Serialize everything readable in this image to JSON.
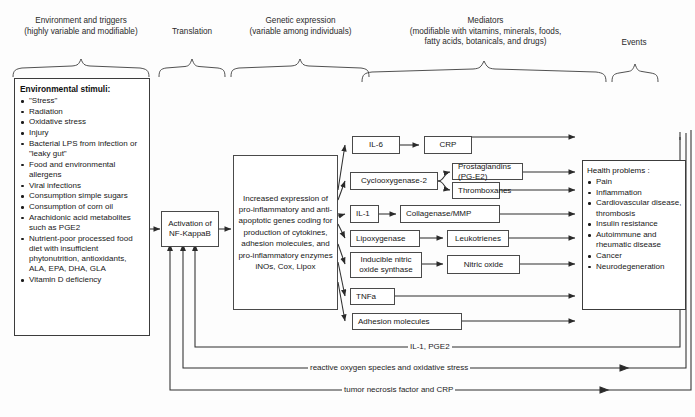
{
  "diagram": {
    "columns": [
      {
        "id": "environment",
        "label": "Environment and triggers\n(highly variable and modifiable)"
      },
      {
        "id": "translation",
        "label": "Translation"
      },
      {
        "id": "genetic",
        "label": "Genetic expression\n(variable among individuals)"
      },
      {
        "id": "mediators",
        "label": "Mediators\n(modifiable with vitamins, minerals, foods,\nfatty acids, botanicals, and drugs)"
      },
      {
        "id": "events",
        "label": "Events"
      }
    ],
    "environment_box": {
      "heading": "Environmental stimuli:",
      "items": [
        "\"Stress\"",
        "Radiation",
        "Oxidative stress",
        "Injury",
        "Bacterial LPS from infection or \"leaky gut\"",
        "Food and environmental allergens",
        "Viral infections",
        "Consumption simple sugars",
        "Consumption of corn oil",
        "Arachidonic acid metabolites such as PGE2",
        "Nutrient-poor processed food diet with insufficient phytonutrition, antioxidants, ALA, EPA, DHA, GLA",
        "Vitamin D deficiency"
      ]
    },
    "translation_box": {
      "label": "Activation of\nNF-KappaB"
    },
    "genetic_box": {
      "label": "Increased expression of pro-inflammatory and anti- apoptotic genes coding for production of cytokines, adhesion molecules, and pro-inflammatory enzymes iNOs, Cox, Lipox"
    },
    "mediators": [
      {
        "id": "il6",
        "label": "IL-6"
      },
      {
        "id": "crp",
        "label": "CRP"
      },
      {
        "id": "cox2",
        "label": "Cyclooxygenase-2"
      },
      {
        "id": "prostaglandins",
        "label": "Prostaglandins (PG-E2)"
      },
      {
        "id": "thromboxanes",
        "label": "Thromboxanes"
      },
      {
        "id": "il1",
        "label": "IL-1"
      },
      {
        "id": "collagenase",
        "label": "Collagenase/MMP"
      },
      {
        "id": "lipoxygenase",
        "label": "Lipoxygenase"
      },
      {
        "id": "leukotrienes",
        "label": "Leukotrienes"
      },
      {
        "id": "inos",
        "label": "Inducible nitric\noxide synthase"
      },
      {
        "id": "nitric-oxide",
        "label": "Nitric oxide"
      },
      {
        "id": "tnfa",
        "label": "TNFa"
      },
      {
        "id": "adhesion",
        "label": "Adhesion molecules"
      }
    ],
    "events_box": {
      "heading": "Health problems  :",
      "items": [
        "Pain",
        "Inflammation",
        "Cardiovascular disease, thrombosis",
        "Insulin resistance",
        "Autoimmune and rheumatic disease",
        "Cancer",
        "Neurodegeneration"
      ]
    },
    "feedback_labels": [
      {
        "id": "fb1",
        "label": "IL-1, PGE2"
      },
      {
        "id": "fb2",
        "label": "reactive oxygen species and oxidative stress"
      },
      {
        "id": "fb3",
        "label": "tumor necrosis factor and  CRP"
      }
    ]
  }
}
